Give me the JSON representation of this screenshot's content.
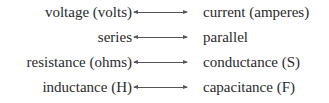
{
  "pairs": [
    {
      "left": "voltage (volts)",
      "arrow": "double-arrow",
      "right": "current (amperes)"
    },
    {
      "left": "series",
      "arrow": "double-arrow",
      "right": "parallel"
    },
    {
      "left": "resistance (ohms)",
      "arrow": "double-arrow",
      "right": "conductance (S)"
    },
    {
      "left": "inductance (H)",
      "arrow": "double-arrow",
      "right": "capacitance (F)"
    }
  ]
}
